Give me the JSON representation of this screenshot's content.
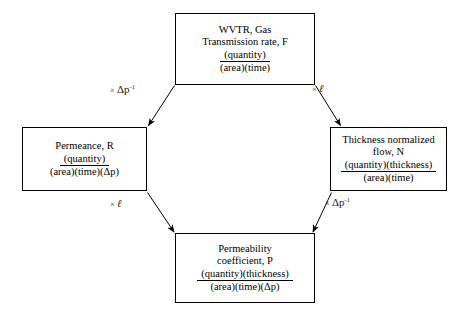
{
  "diagram": {
    "type": "octagon-conversion-diagram",
    "topic": "Permeation property unit conversions",
    "background_color": "#ffffff",
    "line_color": "#000000",
    "nodes": [
      {
        "id": "top",
        "name": "wvtr-gas-transmission-rate",
        "title": "WVTR, Gas\nTransmission rate, F",
        "numerator": "(quantity)",
        "denominator": "(area)(time)"
      },
      {
        "id": "left",
        "name": "permeance",
        "title": "Permeance, R",
        "numerator": "(quantity)",
        "denominator": "(area)(time)(Δp)"
      },
      {
        "id": "right",
        "name": "thickness-normalized-flow",
        "title": "Thickness normalized\nflow, N",
        "numerator": "(quantity)(thickness)",
        "denominator": "(area)(time)"
      },
      {
        "id": "bottom",
        "name": "permeability-coefficient",
        "title": "Permeability\ncoefficient, P",
        "numerator": "(quantity)(thickness)",
        "denominator": "(area)(time)(Δp)"
      }
    ],
    "edges": [
      {
        "id": "top-left",
        "from": "top",
        "to": "left",
        "times": "×",
        "operand": "Δp",
        "exponent": "-1",
        "label": "× Δp⁻¹"
      },
      {
        "id": "top-right",
        "from": "top",
        "to": "right",
        "times": "×",
        "operand": "ℓ",
        "exponent": "",
        "label": "× ℓ"
      },
      {
        "id": "left-bottom",
        "from": "left",
        "to": "bottom",
        "times": "×",
        "operand": "ℓ",
        "exponent": "",
        "label": "× ℓ"
      },
      {
        "id": "right-bottom",
        "from": "right",
        "to": "bottom",
        "times": "×",
        "operand": "Δp",
        "exponent": "-1",
        "label": "× Δp⁻¹"
      }
    ]
  }
}
